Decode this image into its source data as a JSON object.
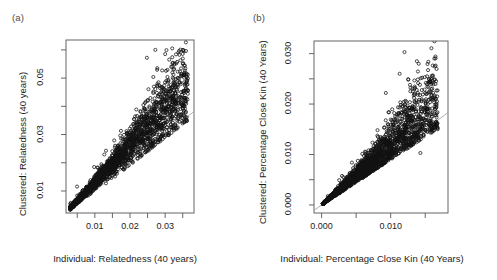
{
  "figure": {
    "background": "#ffffff",
    "marker_color": "#111111",
    "refline_color": "#9a9a9a",
    "axis_color": "#555555"
  },
  "panels": [
    {
      "tag": "(a)",
      "ylabel": "Clustered: Relatedness (40 years)",
      "xlabel": "Individual: Relatedness (40 years)",
      "x_ticks": [
        {
          "value": 0.005,
          "label": ""
        },
        {
          "value": 0.01,
          "label": "0.01"
        },
        {
          "value": 0.015,
          "label": ""
        },
        {
          "value": 0.02,
          "label": "0.02"
        },
        {
          "value": 0.025,
          "label": ""
        },
        {
          "value": 0.03,
          "label": "0.03"
        },
        {
          "value": 0.035,
          "label": ""
        }
      ],
      "y_ticks": [
        {
          "value": 0.01,
          "label": "0.01"
        },
        {
          "value": 0.02,
          "label": ""
        },
        {
          "value": 0.03,
          "label": "0.03"
        },
        {
          "value": 0.04,
          "label": ""
        },
        {
          "value": 0.05,
          "label": "0.05"
        },
        {
          "value": 0.06,
          "label": ""
        }
      ],
      "xlim": [
        0.0018,
        0.0382
      ],
      "ylim": [
        0.0022,
        0.0635
      ],
      "refline": {
        "intercept": 0.0,
        "slope": 1.0
      },
      "scatter": {
        "n": 2600,
        "seed": 1973,
        "x_min": 0.003,
        "x_max": 0.0365,
        "x_shape": 1.85,
        "ratio_mean": 1.3,
        "ratio_spread": 0.2,
        "ratio_min": 0.96,
        "marker_radius": 1.55
      }
    },
    {
      "tag": "(b)",
      "ylabel": "Clustered: Percentage Close Kin (40 Years)",
      "xlabel": "Individual: Percentage Close Kin (40 Years)",
      "x_ticks": [
        {
          "value": 0.0,
          "label": "0.000"
        },
        {
          "value": 0.005,
          "label": ""
        },
        {
          "value": 0.01,
          "label": "0.010"
        },
        {
          "value": 0.015,
          "label": ""
        }
      ],
      "y_ticks": [
        {
          "value": 0.0,
          "label": "0.000"
        },
        {
          "value": 0.005,
          "label": ""
        },
        {
          "value": 0.01,
          "label": "0.010"
        },
        {
          "value": 0.015,
          "label": ""
        },
        {
          "value": 0.02,
          "label": "0.020"
        },
        {
          "value": 0.025,
          "label": ""
        },
        {
          "value": 0.03,
          "label": "0.030"
        }
      ],
      "xlim": [
        -0.0011,
        0.0183
      ],
      "ylim": [
        -0.0016,
        0.0325
      ],
      "refline": {
        "intercept": 0.0,
        "slope": 1.0
      },
      "scatter": {
        "n": 2600,
        "seed": 4421,
        "x_min": 0.0002,
        "x_max": 0.0168,
        "x_shape": 1.75,
        "ratio_mean": 1.18,
        "ratio_spread": 0.28,
        "ratio_min": 0.9,
        "marker_radius": 1.55
      }
    }
  ],
  "chart_data": {
    "type": "scatter",
    "title": "",
    "layout": "two side-by-side R base-graphics scatterplots, open circle markers (pch=1), grey 1:1 reference line, no grid",
    "grid": false,
    "legend": "none",
    "subplots": [
      {
        "tag": "(a)",
        "xlabel": "Individual: Relatedness (40 years)",
        "ylabel": "Clustered: Relatedness (40 years)",
        "xlim": [
          0.0018,
          0.0382
        ],
        "ylim": [
          0.0022,
          0.0635
        ],
        "x_tick_labels": [
          "0.01",
          "0.02",
          "0.03"
        ],
        "y_tick_labels": [
          "0.01",
          "0.03",
          "0.05"
        ],
        "n_points": 2600,
        "reference_line": {
          "type": "identity",
          "slope": 1,
          "intercept": 0,
          "color": "#9a9a9a"
        },
        "description": "Dense elongated cloud from lower-left origin rising to upper-right; clustered values exceed individual values, so nearly all points sit above the 1:1 line. Scatter widens with x. Outliers reach y about 0.060 near x about 0.027-0.030.",
        "sample_points": [
          [
            0.0035,
            0.0042
          ],
          [
            0.0048,
            0.006
          ],
          [
            0.0062,
            0.008
          ],
          [
            0.0075,
            0.0098
          ],
          [
            0.009,
            0.0118
          ],
          [
            0.0105,
            0.0138
          ],
          [
            0.012,
            0.0158
          ],
          [
            0.0135,
            0.0176
          ],
          [
            0.015,
            0.0196
          ],
          [
            0.0165,
            0.0214
          ],
          [
            0.018,
            0.0234
          ],
          [
            0.0195,
            0.0252
          ],
          [
            0.021,
            0.0272
          ],
          [
            0.0225,
            0.0292
          ],
          [
            0.024,
            0.031
          ],
          [
            0.0255,
            0.033
          ],
          [
            0.027,
            0.0348
          ],
          [
            0.0285,
            0.0368
          ],
          [
            0.03,
            0.0386
          ],
          [
            0.032,
            0.0408
          ],
          [
            0.034,
            0.043
          ],
          [
            0.036,
            0.0452
          ],
          [
            0.0272,
            0.06
          ],
          [
            0.03,
            0.0585
          ],
          [
            0.0248,
            0.0572
          ],
          [
            0.0345,
            0.0508
          ],
          [
            0.036,
            0.0352
          ],
          [
            0.021,
            0.03
          ]
        ]
      },
      {
        "tag": "(b)",
        "xlabel": "Individual: Percentage Close Kin (40 Years)",
        "ylabel": "Clustered: Percentage Close Kin (40 Years)",
        "xlim": [
          -0.0011,
          0.0183
        ],
        "ylim": [
          -0.0016,
          0.0325
        ],
        "x_tick_labels": [
          "0.000",
          "0.010"
        ],
        "y_tick_labels": [
          "0.000",
          "0.010",
          "0.020",
          "0.030"
        ],
        "n_points": 2600,
        "reference_line": {
          "type": "identity",
          "slope": 1,
          "intercept": 0,
          "color": "#9a9a9a"
        },
        "description": "Dense cloud from origin spreading upward-right with a wider fan than panel (a); the 1:1 grey line passes through the lower-middle of the cloud. High outliers near x about 0.012 reach y about 0.030 and 0.026.",
        "sample_points": [
          [
            0.0005,
            0.0007
          ],
          [
            0.0012,
            0.0017
          ],
          [
            0.002,
            0.0026
          ],
          [
            0.003,
            0.0038
          ],
          [
            0.004,
            0.005
          ],
          [
            0.005,
            0.0062
          ],
          [
            0.006,
            0.0075
          ],
          [
            0.007,
            0.0086
          ],
          [
            0.008,
            0.0098
          ],
          [
            0.009,
            0.011
          ],
          [
            0.01,
            0.0122
          ],
          [
            0.011,
            0.0134
          ],
          [
            0.012,
            0.0145
          ],
          [
            0.013,
            0.0152
          ],
          [
            0.014,
            0.016
          ],
          [
            0.015,
            0.0168
          ],
          [
            0.016,
            0.0175
          ],
          [
            0.012,
            0.0303
          ],
          [
            0.0113,
            0.026
          ],
          [
            0.0128,
            0.0238
          ],
          [
            0.0093,
            0.0222
          ],
          [
            0.015,
            0.0222
          ],
          [
            0.0168,
            0.015
          ],
          [
            0.0143,
            0.0103
          ]
        ]
      }
    ]
  }
}
